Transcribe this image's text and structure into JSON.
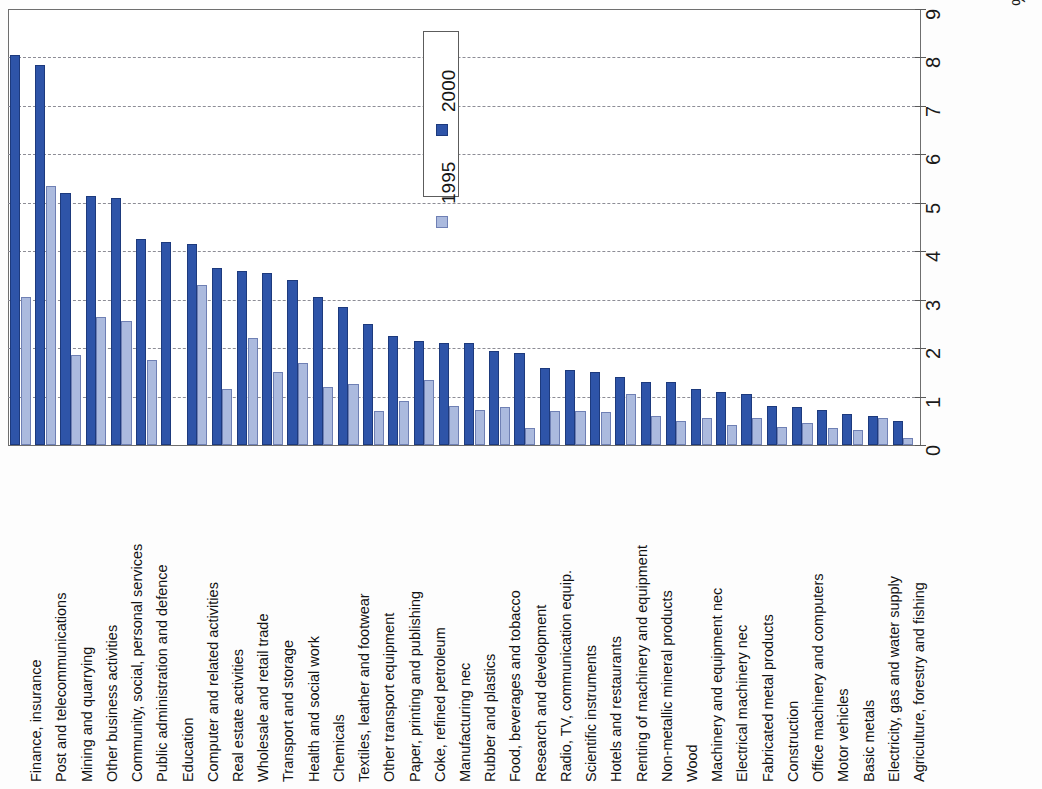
{
  "chart_data": {
    "type": "bar",
    "title": "",
    "subtitle": "",
    "xlabel": "",
    "ylabel": "%",
    "ylim": [
      0,
      9
    ],
    "yticks": [
      0,
      1,
      2,
      3,
      4,
      5,
      6,
      7,
      8,
      9
    ],
    "ytick_labels": [
      "0",
      "1",
      "2",
      "3",
      "4",
      "5",
      "6",
      "7",
      "8",
      "9"
    ],
    "grid": true,
    "grid_axis": "value",
    "orientation": "vertical-bars-rotated-labels",
    "legend_position": "top-center-inside",
    "legend": [
      "2000",
      "1995"
    ],
    "axis_unit": "%",
    "categories": [
      "Finance, insurance",
      "Post and telecommunications",
      "Mining and quarrying",
      "Other business activities",
      "Community, social, personal services",
      "Public administration and defence",
      "Education",
      "Computer and related activities",
      "Real estate activities",
      "Wholesale and retail trade",
      "Transport and storage",
      "Health and social work",
      "Chemicals",
      "Textiles, leather and footwear",
      "Other transport equipment",
      "Paper, printing and publishing",
      "Coke, refined petroleum",
      "Manufacturing nec",
      "Rubber and plastics",
      "Food, beverages and tobacco",
      "Research and development",
      "Radio, TV, communication equip.",
      "Scientific instruments",
      "Hotels and restaurants",
      "Renting of machinery and equipment",
      "Non-metallic mineral products",
      "Wood",
      "Machinery and equipment nec",
      "Electrical machinery nec",
      "Fabricated metal products",
      "Construction",
      "Office machinery and computers",
      "Motor vehicles",
      "Basic metals",
      "Electricity, gas and water supply",
      "Agriculture, forestry and fishing"
    ],
    "series": [
      {
        "name": "2000",
        "color": "#2e54a8",
        "values": [
          8.05,
          7.85,
          5.2,
          5.15,
          5.1,
          4.25,
          4.2,
          4.15,
          3.65,
          3.6,
          3.55,
          3.4,
          3.05,
          2.85,
          2.5,
          2.25,
          2.15,
          2.1,
          2.1,
          1.95,
          1.9,
          1.6,
          1.55,
          1.5,
          1.4,
          1.3,
          1.3,
          1.15,
          1.1,
          1.05,
          0.8,
          0.78,
          0.72,
          0.65,
          0.6,
          0.5
        ]
      },
      {
        "name": "1995",
        "color": "#abbade",
        "values": [
          3.05,
          5.35,
          1.85,
          2.65,
          2.55,
          1.75,
          0.0,
          3.3,
          1.15,
          2.2,
          1.5,
          1.7,
          1.2,
          1.25,
          0.7,
          0.9,
          1.35,
          0.8,
          0.72,
          0.78,
          0.35,
          0.7,
          0.7,
          0.68,
          1.05,
          0.6,
          0.5,
          0.55,
          0.42,
          0.55,
          0.38,
          0.45,
          0.35,
          0.3,
          0.55,
          0.15
        ]
      }
    ],
    "note_categories_count": 36
  },
  "legend": {
    "items": [
      {
        "label": "2000",
        "color": "#2e54a8"
      },
      {
        "label": "1995",
        "color": "#abbade"
      }
    ]
  },
  "axis": {
    "unit_label": "%",
    "tick_labels": [
      "0",
      "1",
      "2",
      "3",
      "4",
      "5",
      "6",
      "7",
      "8",
      "9"
    ]
  }
}
